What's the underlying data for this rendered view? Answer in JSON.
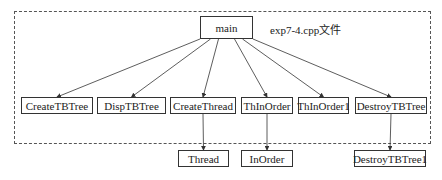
{
  "diagram": {
    "caption": "exp7-4.cpp文件",
    "root": {
      "id": "main",
      "label": "main"
    },
    "level1": [
      {
        "id": "CreateTBTree",
        "label": "CreateTBTree"
      },
      {
        "id": "DispTBTree",
        "label": "DispTBTree"
      },
      {
        "id": "CreateThread",
        "label": "CreateThread"
      },
      {
        "id": "ThInOrder",
        "label": "ThInOrder"
      },
      {
        "id": "ThInOrder1",
        "label": "ThInOrder1"
      },
      {
        "id": "DestroyTBTree",
        "label": "DestroyTBTree"
      }
    ],
    "level2": [
      {
        "id": "Thread",
        "label": "Thread",
        "parent": "CreateThread"
      },
      {
        "id": "InOrder",
        "label": "InOrder",
        "parent": "ThInOrder"
      },
      {
        "id": "DestroyTBTree1",
        "label": "DestroyTBTree1",
        "parent": "DestroyTBTree"
      }
    ],
    "edges": [
      [
        "main",
        "CreateTBTree"
      ],
      [
        "main",
        "DispTBTree"
      ],
      [
        "main",
        "CreateThread"
      ],
      [
        "main",
        "ThInOrder"
      ],
      [
        "main",
        "ThInOrder1"
      ],
      [
        "main",
        "DestroyTBTree"
      ],
      [
        "CreateThread",
        "Thread"
      ],
      [
        "ThInOrder",
        "InOrder"
      ],
      [
        "DestroyTBTree",
        "DestroyTBTree1"
      ]
    ]
  }
}
